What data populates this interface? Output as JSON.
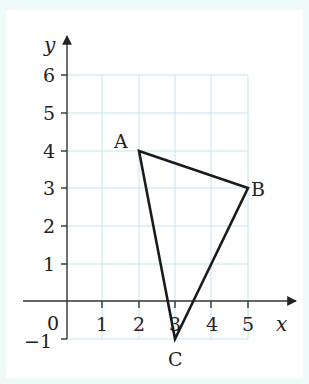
{
  "diagram": {
    "x_axis_label": "x",
    "y_axis_label": "y",
    "origin_label": "0",
    "x_ticks": [
      "1",
      "2",
      "3",
      "4",
      "5"
    ],
    "y_ticks": [
      "6",
      "5",
      "4",
      "3",
      "2",
      "1",
      "−1"
    ],
    "points": [
      {
        "label": "A",
        "x": 2,
        "y": 4
      },
      {
        "label": "B",
        "x": 5,
        "y": 3
      },
      {
        "label": "C",
        "x": 3,
        "y": -1
      }
    ],
    "colors": {
      "grid": "#bfe6ec",
      "axis": "#333333",
      "triangle": "#1a1a1a",
      "background": "#ffffff",
      "border": "#eef9f8"
    }
  }
}
